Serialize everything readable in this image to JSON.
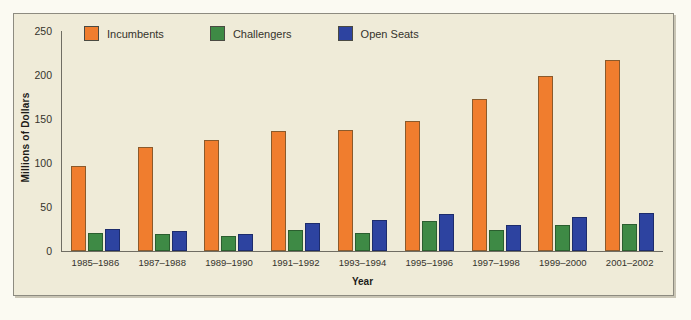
{
  "chart_data": {
    "type": "bar",
    "title": "",
    "xlabel": "Year",
    "ylabel": "Millions of Dollars",
    "ylim": [
      0,
      250
    ],
    "yticks": [
      250,
      200,
      150,
      100,
      50,
      0
    ],
    "grid": false,
    "legend_position": "top",
    "categories": [
      "1985–1986",
      "1987–1988",
      "1989–1990",
      "1991–1992",
      "1993–1994",
      "1995–1996",
      "1997–1998",
      "1999–2000",
      "2001–2002"
    ],
    "series": [
      {
        "name": "Incumbents",
        "color": "#f07d2e",
        "values": [
          97,
          118,
          126,
          136,
          138,
          148,
          173,
          199,
          217
        ]
      },
      {
        "name": "Challengers",
        "color": "#3e8a45",
        "values": [
          20,
          19,
          17,
          24,
          20,
          34,
          24,
          30,
          31
        ]
      },
      {
        "name": "Open Seats",
        "color": "#2d43a0",
        "values": [
          25,
          23,
          19,
          32,
          35,
          42,
          30,
          39,
          43
        ]
      }
    ]
  }
}
